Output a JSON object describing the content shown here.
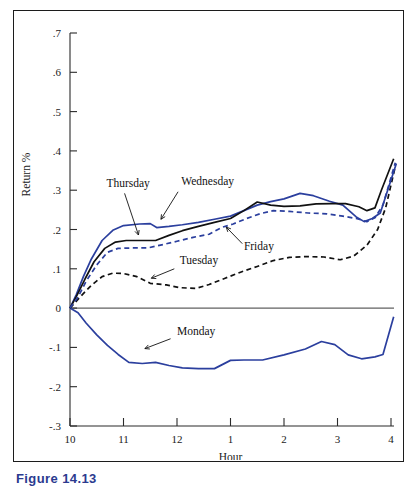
{
  "caption": {
    "text": "Figure 14.13"
  },
  "chart_data": {
    "type": "line",
    "title": "",
    "xlabel": "Hour",
    "ylabel": "Return %",
    "xlim": [
      10,
      16.1
    ],
    "ylim": [
      -0.3,
      0.7
    ],
    "grid": false,
    "legend": "inline-labels",
    "x_tick_values": [
      10,
      11,
      12,
      13,
      14,
      15,
      16
    ],
    "x_tick_labels": [
      "10",
      "11",
      "12",
      "1",
      "2",
      "3",
      "4"
    ],
    "y_tick_values": [
      0.7,
      0.6,
      0.5,
      0.4,
      0.3,
      0.2,
      0.1,
      0,
      -0.1,
      -0.2,
      -0.3
    ],
    "y_tick_labels": [
      ".7",
      ".6",
      ".5",
      ".4",
      ".3",
      ".2",
      ".1",
      "0",
      "-.1",
      "-.2",
      "-.3"
    ],
    "zero_reference_line": 0,
    "series": [
      {
        "name": "Monday",
        "color": "#2b3f9e",
        "style": "solid",
        "width": 1.7,
        "label_x": 12.0,
        "label_y": -0.068,
        "leader_from": [
          11.88,
          -0.078
        ],
        "leader_to": [
          11.4,
          -0.103
        ],
        "x": [
          10.0,
          10.15,
          10.3,
          10.5,
          10.7,
          10.9,
          11.1,
          11.35,
          11.6,
          11.85,
          12.1,
          12.4,
          12.7,
          13.0,
          13.25,
          13.6,
          14.0,
          14.4,
          14.7,
          14.95,
          15.2,
          15.45,
          15.7,
          15.85,
          16.05
        ],
        "y": [
          0.0,
          -0.012,
          -0.038,
          -0.068,
          -0.095,
          -0.118,
          -0.138,
          -0.141,
          -0.138,
          -0.146,
          -0.152,
          -0.154,
          -0.154,
          -0.133,
          -0.132,
          -0.132,
          -0.119,
          -0.104,
          -0.085,
          -0.093,
          -0.119,
          -0.129,
          -0.124,
          -0.118,
          -0.022
        ]
      },
      {
        "name": "Tuesday",
        "color": "#111111",
        "style": "dashed",
        "width": 1.7,
        "label_x": 12.05,
        "label_y": 0.112,
        "leader_from": [
          11.95,
          0.1
        ],
        "leader_to": [
          11.52,
          0.076
        ],
        "x": [
          10.0,
          10.2,
          10.4,
          10.6,
          10.8,
          11.0,
          11.25,
          11.5,
          11.8,
          12.05,
          12.35,
          12.6,
          12.9,
          13.2,
          13.5,
          13.8,
          14.1,
          14.4,
          14.75,
          15.05,
          15.3,
          15.55,
          15.75,
          15.9,
          16.08
        ],
        "y": [
          0.0,
          0.03,
          0.058,
          0.08,
          0.089,
          0.088,
          0.08,
          0.063,
          0.059,
          0.052,
          0.05,
          0.06,
          0.076,
          0.092,
          0.106,
          0.121,
          0.129,
          0.131,
          0.13,
          0.123,
          0.132,
          0.16,
          0.2,
          0.255,
          0.36
        ]
      },
      {
        "name": "Wednesday",
        "color": "#2b3f9e",
        "style": "solid",
        "width": 1.7,
        "label_x": 12.08,
        "label_y": 0.312,
        "leader_from": [
          12.02,
          0.296
        ],
        "leader_to": [
          11.7,
          0.226
        ],
        "x": [
          10.0,
          10.12,
          10.25,
          10.4,
          10.6,
          10.8,
          11.0,
          11.3,
          11.5,
          11.62,
          11.85,
          12.1,
          12.4,
          12.7,
          13.0,
          13.25,
          13.5,
          13.75,
          14.0,
          14.3,
          14.55,
          14.85,
          15.1,
          15.35,
          15.5,
          15.65,
          15.8,
          16.1
        ],
        "y": [
          0.0,
          0.035,
          0.08,
          0.125,
          0.172,
          0.198,
          0.21,
          0.214,
          0.215,
          0.205,
          0.208,
          0.212,
          0.218,
          0.226,
          0.234,
          0.248,
          0.262,
          0.271,
          0.278,
          0.292,
          0.286,
          0.272,
          0.262,
          0.232,
          0.22,
          0.228,
          0.242,
          0.368
        ]
      },
      {
        "name": "Thursday",
        "color": "#111111",
        "style": "solid",
        "width": 1.7,
        "label_x": 10.68,
        "label_y": 0.308,
        "leader_from": [
          11.02,
          0.292
        ],
        "leader_to": [
          11.28,
          0.186
        ],
        "x": [
          10.0,
          10.12,
          10.28,
          10.45,
          10.65,
          10.85,
          11.05,
          11.35,
          11.6,
          11.85,
          12.1,
          12.4,
          12.7,
          13.0,
          13.25,
          13.5,
          13.75,
          14.0,
          14.3,
          14.6,
          14.9,
          15.15,
          15.4,
          15.55,
          15.7,
          15.82,
          16.05
        ],
        "y": [
          0.0,
          0.03,
          0.074,
          0.118,
          0.152,
          0.168,
          0.172,
          0.172,
          0.172,
          0.185,
          0.197,
          0.208,
          0.218,
          0.228,
          0.248,
          0.27,
          0.262,
          0.259,
          0.26,
          0.265,
          0.266,
          0.266,
          0.258,
          0.248,
          0.255,
          0.3,
          0.38
        ]
      },
      {
        "name": "Friday",
        "color": "#2b3f9e",
        "style": "dashed",
        "width": 1.7,
        "label_x": 13.25,
        "label_y": 0.148,
        "leader_from": [
          13.22,
          0.164
        ],
        "leader_to": [
          12.92,
          0.206
        ],
        "x": [
          10.0,
          10.15,
          10.3,
          10.5,
          10.7,
          10.9,
          11.15,
          11.45,
          11.75,
          12.0,
          12.3,
          12.6,
          12.85,
          13.05,
          13.3,
          13.55,
          13.8,
          14.1,
          14.45,
          14.8,
          15.1,
          15.35,
          15.55,
          15.7,
          15.85,
          16.08
        ],
        "y": [
          0.0,
          0.028,
          0.068,
          0.11,
          0.142,
          0.152,
          0.153,
          0.153,
          0.162,
          0.17,
          0.18,
          0.188,
          0.206,
          0.214,
          0.228,
          0.24,
          0.248,
          0.246,
          0.242,
          0.24,
          0.234,
          0.228,
          0.22,
          0.23,
          0.262,
          0.37
        ]
      }
    ]
  }
}
